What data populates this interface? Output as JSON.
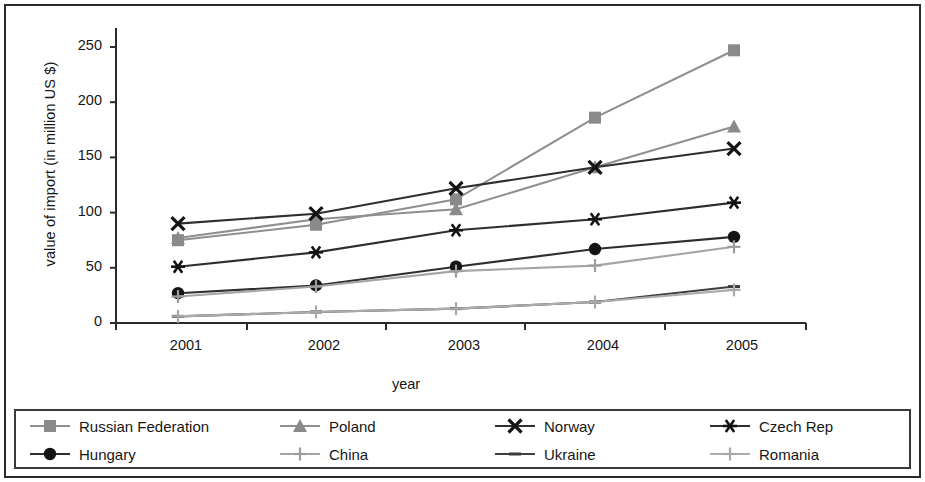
{
  "chart_data": {
    "type": "line",
    "title": "",
    "xlabel": "year",
    "ylabel": "value of import (in million US $)",
    "categories": [
      "2001",
      "2002",
      "2003",
      "2004",
      "2005"
    ],
    "x_tick_labels": [
      "2001",
      "2002",
      "2003",
      "2004",
      "2005"
    ],
    "y_tick_labels": [
      "0",
      "50",
      "100",
      "150",
      "200",
      "250"
    ],
    "y_ticks": [
      0,
      50,
      100,
      150,
      200,
      250
    ],
    "ylim": [
      0,
      275
    ],
    "grid": false,
    "legend_position": "bottom",
    "series": [
      {
        "name": "Russian Federation",
        "marker": "square",
        "color": "#8a8a8a",
        "line_color": "#8f8f8f",
        "values": [
          75,
          89,
          112,
          186,
          247
        ]
      },
      {
        "name": "Poland",
        "marker": "triangle",
        "color": "#8a8a8a",
        "line_color": "#8f8f8f",
        "values": [
          77,
          94,
          103,
          141,
          178
        ]
      },
      {
        "name": "Norway",
        "marker": "x",
        "color": "#141414",
        "line_color": "#2e2e2e",
        "values": [
          90,
          99,
          122,
          141,
          158
        ]
      },
      {
        "name": "Czech Rep",
        "marker": "asterisk",
        "color": "#141414",
        "line_color": "#2e2e2e",
        "values": [
          51,
          64,
          84,
          94,
          109
        ]
      },
      {
        "name": "Hungary",
        "marker": "circle",
        "color": "#141414",
        "line_color": "#2e2e2e",
        "values": [
          27,
          34,
          51,
          67,
          78
        ]
      },
      {
        "name": "China",
        "marker": "plus",
        "color": "#9d9d9d",
        "line_color": "#a5a5a5",
        "values": [
          24,
          33,
          47,
          52,
          69
        ]
      },
      {
        "name": "Ukraine",
        "marker": "dash",
        "color": "#3a3a3a",
        "line_color": "#3f3f3f",
        "values": [
          6,
          10,
          13,
          19,
          33
        ]
      },
      {
        "name": "Romania",
        "marker": "plus",
        "color": "#a8a8a8",
        "line_color": "#ababab",
        "values": [
          6,
          10,
          13,
          19,
          30
        ]
      }
    ]
  },
  "legend": {
    "items": [
      {
        "label": "Russian Federation"
      },
      {
        "label": "Poland"
      },
      {
        "label": "Norway"
      },
      {
        "label": "Czech Rep"
      },
      {
        "label": "Hungary"
      },
      {
        "label": "China"
      },
      {
        "label": "Ukraine"
      },
      {
        "label": "Romania"
      }
    ]
  }
}
